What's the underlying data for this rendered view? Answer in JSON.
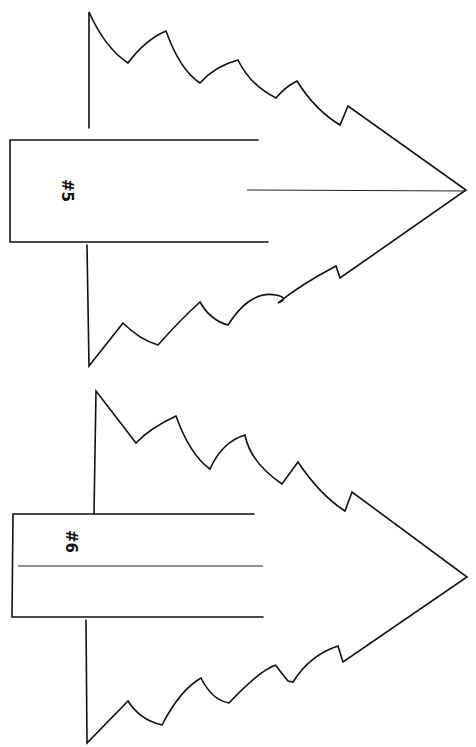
{
  "page": {
    "background": "#ffffff",
    "line_color": "#111111"
  },
  "templates": [
    {
      "id": "tree-5",
      "label": "#5",
      "orientation": "rotated-90",
      "trunk_divider_lines": 0
    },
    {
      "id": "tree-6",
      "label": "#6",
      "orientation": "rotated-90",
      "trunk_divider_lines": 1
    }
  ]
}
